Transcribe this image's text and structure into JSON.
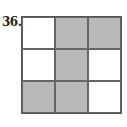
{
  "problem": {
    "number": "36.",
    "grid": {
      "rows": 3,
      "cols": 3,
      "shaded": [
        [
          false,
          true,
          true
        ],
        [
          false,
          true,
          false
        ],
        [
          true,
          true,
          false
        ]
      ],
      "shade_color": "#b9b9b9",
      "line_color": "#555555"
    }
  }
}
